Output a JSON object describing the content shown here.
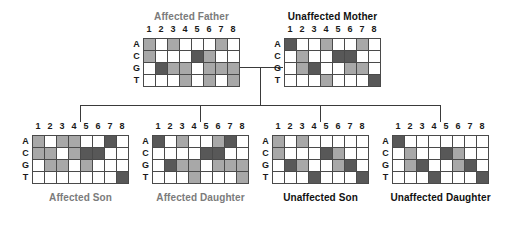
{
  "figure": {
    "kind": "pedigree-genotype-chart",
    "row_labels": [
      "A",
      "C",
      "G",
      "T"
    ],
    "column_labels": [
      "1",
      "2",
      "3",
      "4",
      "5",
      "6",
      "7",
      "8"
    ],
    "shading_legend": {
      "0": "white / absent",
      "1": "light gray / heterozygous",
      "2": "dark gray / homozygous"
    },
    "colors": {
      "empty": "#ffffff",
      "light": "#a8a8a8",
      "dark": "#585858",
      "grid_line": "#4a4a4a",
      "connector": "#3a3a3a",
      "affected_label": "#7b7b7b",
      "unaffected_label": "#111111"
    }
  },
  "panels": [
    {
      "id": "affected-father",
      "title": "Affected Father",
      "status": "affected",
      "generation": "parent",
      "matrix": [
        [
          1,
          0,
          1,
          0,
          0,
          0,
          1,
          0
        ],
        [
          1,
          0,
          0,
          0,
          2,
          1,
          0,
          0
        ],
        [
          0,
          2,
          1,
          1,
          0,
          1,
          1,
          1
        ],
        [
          0,
          0,
          0,
          1,
          0,
          1,
          0,
          1
        ]
      ]
    },
    {
      "id": "unaffected-mother",
      "title": "Unaffected Mother",
      "status": "unaffected",
      "generation": "parent",
      "matrix": [
        [
          2,
          0,
          0,
          1,
          0,
          0,
          1,
          0
        ],
        [
          0,
          1,
          0,
          0,
          2,
          2,
          0,
          0
        ],
        [
          0,
          1,
          2,
          0,
          0,
          1,
          1,
          0
        ],
        [
          0,
          0,
          0,
          1,
          0,
          0,
          0,
          2
        ]
      ]
    },
    {
      "id": "affected-son",
      "title": "Affected Son",
      "status": "affected",
      "generation": "child",
      "matrix": [
        [
          1,
          0,
          1,
          1,
          0,
          0,
          2,
          0
        ],
        [
          1,
          1,
          0,
          1,
          2,
          2,
          0,
          0
        ],
        [
          0,
          1,
          1,
          0,
          1,
          0,
          0,
          0
        ],
        [
          0,
          0,
          0,
          0,
          0,
          0,
          0,
          2
        ]
      ]
    },
    {
      "id": "affected-daughter",
      "title": "Affected Daughter",
      "status": "affected",
      "generation": "child",
      "matrix": [
        [
          2,
          0,
          1,
          0,
          0,
          1,
          2,
          0
        ],
        [
          0,
          0,
          0,
          0,
          2,
          2,
          0,
          0
        ],
        [
          0,
          2,
          1,
          1,
          0,
          1,
          1,
          1
        ],
        [
          0,
          0,
          0,
          1,
          0,
          0,
          0,
          1
        ]
      ]
    },
    {
      "id": "unaffected-son",
      "title": "Unaffected Son",
      "status": "unaffected",
      "generation": "child",
      "matrix": [
        [
          1,
          0,
          1,
          0,
          0,
          0,
          0,
          0
        ],
        [
          1,
          0,
          0,
          0,
          2,
          1,
          0,
          0
        ],
        [
          0,
          2,
          1,
          0,
          0,
          1,
          2,
          0
        ],
        [
          0,
          0,
          0,
          2,
          0,
          0,
          0,
          2
        ]
      ]
    },
    {
      "id": "unaffected-daughter",
      "title": "Unaffected Daughter",
      "status": "unaffected",
      "generation": "child",
      "matrix": [
        [
          2,
          0,
          0,
          0,
          0,
          0,
          0,
          0
        ],
        [
          0,
          1,
          0,
          0,
          2,
          1,
          0,
          0
        ],
        [
          0,
          1,
          2,
          0,
          0,
          1,
          2,
          0
        ],
        [
          0,
          0,
          0,
          2,
          0,
          0,
          0,
          2
        ]
      ]
    }
  ]
}
